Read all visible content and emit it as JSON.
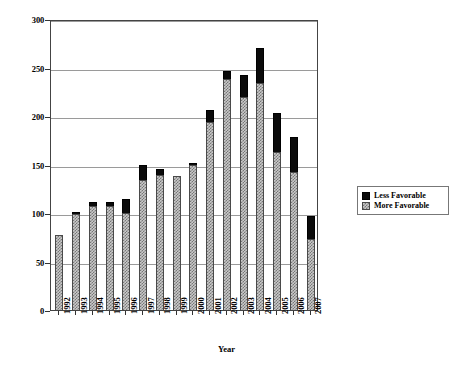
{
  "chart_data": {
    "type": "bar",
    "title": "",
    "xlabel": "Year",
    "ylabel": "Number of Measures",
    "ylim": [
      0,
      300
    ],
    "yticks": [
      0,
      50,
      100,
      150,
      200,
      250,
      300
    ],
    "grid": true,
    "stacked": true,
    "legend_position": "right",
    "categories": [
      "1992",
      "1993",
      "1994",
      "1995",
      "1996",
      "1997",
      "1998",
      "1999",
      "2000",
      "2001",
      "2002",
      "2003",
      "2004",
      "2005",
      "2006",
      "2007"
    ],
    "series": [
      {
        "name": "More Favorable",
        "color": "#c9c9c9",
        "pattern": "hatched",
        "values": [
          77,
          99,
          107,
          107,
          100,
          134,
          139,
          138,
          149,
          194,
          238,
          220,
          234,
          163,
          142,
          73
        ]
      },
      {
        "name": "Less Favorable",
        "color": "#0b0b0b",
        "pattern": "solid",
        "values": [
          0,
          1,
          4,
          4,
          14,
          16,
          6,
          0,
          2,
          12,
          8,
          22,
          36,
          40,
          36,
          24
        ]
      }
    ],
    "totals": [
      77,
      100,
      111,
      111,
      114,
      150,
      145,
      138,
      151,
      206,
      246,
      242,
      270,
      203,
      178,
      97
    ]
  },
  "legend": {
    "items": [
      {
        "label": "Less Favorable",
        "swatch": "black-square-icon"
      },
      {
        "label": "More Favorable",
        "swatch": "hatched-square-icon"
      }
    ]
  }
}
